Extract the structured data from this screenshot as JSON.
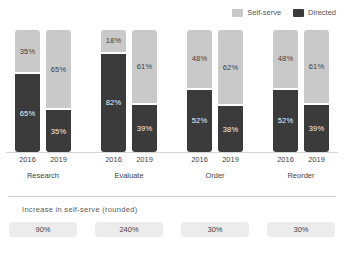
{
  "title_remnant": "",
  "legend": {
    "position": "top-right",
    "items": [
      {
        "label": "Self-serve",
        "color": "#c9c9c9",
        "icon": "legend-swatch-icon"
      },
      {
        "label": "Directed",
        "color": "#3b3b3b",
        "icon": "legend-swatch-icon"
      }
    ]
  },
  "footer": {
    "caption": "Increase in self-serve (rounded)",
    "badges": [
      "90%",
      "240%",
      "30%",
      "30%"
    ]
  },
  "chart_data": {
    "type": "bar",
    "subtype": "stacked-100-percent-grouped",
    "title": "",
    "xlabel": "",
    "ylabel": "",
    "ylim": [
      0,
      100
    ],
    "grid": false,
    "legend_position": "top-right",
    "categories": [
      "Research",
      "Evaluate",
      "Order",
      "Reorder"
    ],
    "subcategories": [
      "2016",
      "2019"
    ],
    "series": [
      {
        "name": "Self-serve",
        "color": "#c9c9c9",
        "values": [
          [
            35,
            65
          ],
          [
            18,
            61
          ],
          [
            48,
            62
          ],
          [
            48,
            61
          ]
        ]
      },
      {
        "name": "Directed",
        "color": "#3b3b3b",
        "values": [
          [
            65,
            35
          ],
          [
            82,
            39
          ],
          [
            52,
            38
          ],
          [
            52,
            39
          ]
        ]
      }
    ],
    "annotations": {
      "caption": "Increase in self-serve (rounded)",
      "increase_in_self_serve": [
        "90%",
        "240%",
        "30%",
        "30%"
      ]
    },
    "groups": [
      {
        "category": "Research",
        "bars": [
          {
            "year": "2016",
            "self_serve": "35%",
            "directed": "65%",
            "self_pct": 35,
            "dir_pct": 65
          },
          {
            "year": "2019",
            "self_serve": "65%",
            "directed": "35%",
            "self_pct": 65,
            "dir_pct": 35
          }
        ],
        "increase": "90%"
      },
      {
        "category": "Evaluate",
        "bars": [
          {
            "year": "2016",
            "self_serve": "18%",
            "directed": "82%",
            "self_pct": 18,
            "dir_pct": 82
          },
          {
            "year": "2019",
            "self_serve": "61%",
            "directed": "39%",
            "self_pct": 61,
            "dir_pct": 39
          }
        ],
        "increase": "240%"
      },
      {
        "category": "Order",
        "bars": [
          {
            "year": "2016",
            "self_serve": "48%",
            "directed": "52%",
            "self_pct": 48,
            "dir_pct": 52
          },
          {
            "year": "2019",
            "self_serve": "62%",
            "directed": "38%",
            "self_pct": 62,
            "dir_pct": 38
          }
        ],
        "increase": "30%"
      },
      {
        "category": "Reorder",
        "bars": [
          {
            "year": "2016",
            "self_serve": "48%",
            "directed": "52%",
            "self_pct": 48,
            "dir_pct": 52
          },
          {
            "year": "2019",
            "self_serve": "61%",
            "directed": "39%",
            "self_pct": 61,
            "dir_pct": 39
          }
        ],
        "increase": "30%"
      }
    ]
  }
}
